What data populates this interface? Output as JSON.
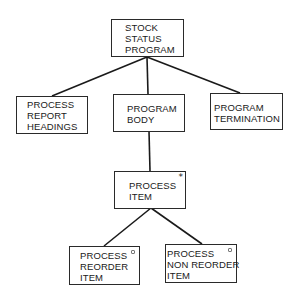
{
  "diagram": {
    "type": "jackson-structure-chart",
    "nodes": [
      {
        "id": "root",
        "label": "STOCK\nSTATUS\nPROGRAM",
        "marker": ""
      },
      {
        "id": "headings",
        "label": "PROCESS\nREPORT\nHEADINGS",
        "marker": ""
      },
      {
        "id": "body",
        "label": "PROGRAM\nBODY",
        "marker": ""
      },
      {
        "id": "termination",
        "label": "PROGRAM\nTERMINATION",
        "marker": ""
      },
      {
        "id": "item",
        "label": "PROCESS\nITEM",
        "marker": "*"
      },
      {
        "id": "reorder",
        "label": "PROCESS\nREORDER\nITEM",
        "marker": "o"
      },
      {
        "id": "nonreorder",
        "label": "PROCESS\nNON REORDER\nITEM",
        "marker": "o"
      }
    ],
    "edges": [
      {
        "from": "root",
        "to": "headings"
      },
      {
        "from": "root",
        "to": "body"
      },
      {
        "from": "root",
        "to": "termination"
      },
      {
        "from": "body",
        "to": "item"
      },
      {
        "from": "item",
        "to": "reorder"
      },
      {
        "from": "item",
        "to": "nonreorder"
      }
    ],
    "colors": {
      "line": "#1a1a1a",
      "box_border": "#2a2a2a",
      "background": "#ffffff",
      "text": "#1a1a1a"
    }
  }
}
